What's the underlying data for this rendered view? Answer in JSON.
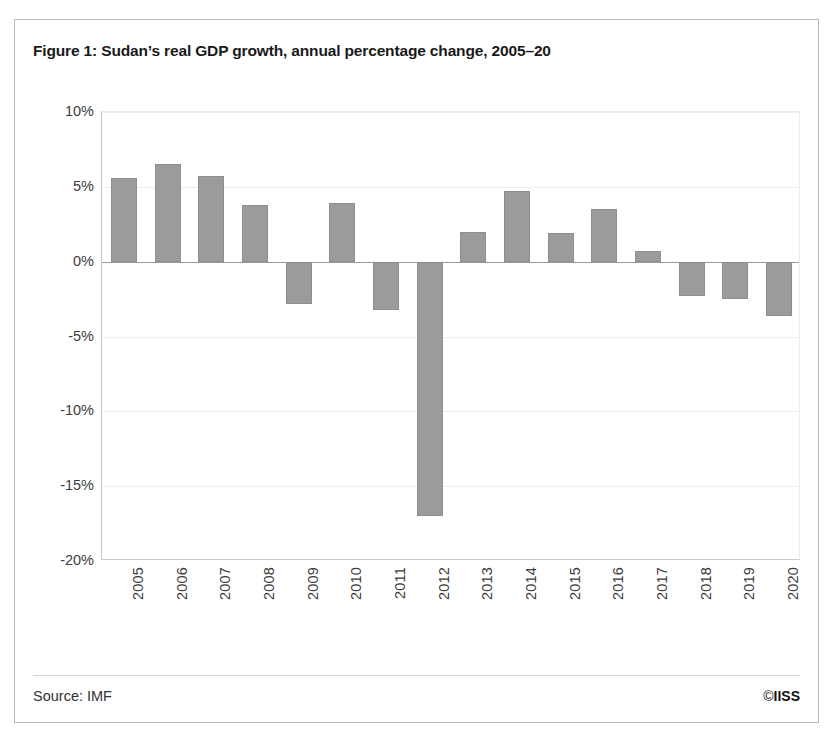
{
  "figure": {
    "title": "Figure 1: Sudan’s real GDP growth, annual percentage change, 2005–20",
    "source": "Source: IMF",
    "copyright_symbol": "©",
    "copyright_owner": "IISS"
  },
  "style": {
    "bar_color": "#9b9b9b",
    "bar_border_color": "#8e8e8e",
    "gridline_color": "#ededed",
    "zero_line_color": "#9a9a9a",
    "axis_color": "#c4c4c4",
    "frame_color": "#b9b9b9",
    "text_color": "#3c3c3c",
    "title_color": "#1a1a1a",
    "background": "#ffffff"
  },
  "chart_data": {
    "type": "bar",
    "title": "Figure 1: Sudan’s real GDP growth, annual percentage change, 2005–20",
    "xlabel": "",
    "ylabel": "",
    "ylim": [
      -20,
      10
    ],
    "ytick_values": [
      10,
      5,
      0,
      -5,
      -10,
      -15,
      -20
    ],
    "ytick_labels": [
      "10%",
      "5%",
      "0%",
      "-5%",
      "-10%",
      "-15%",
      "-20%"
    ],
    "grid": true,
    "grid_axis": "y",
    "legend": false,
    "categories": [
      "2005",
      "2006",
      "2007",
      "2008",
      "2009",
      "2010",
      "2011",
      "2012",
      "2013",
      "2014",
      "2015",
      "2016",
      "2017",
      "2018",
      "2019",
      "2020"
    ],
    "values": [
      5.6,
      6.5,
      5.7,
      3.8,
      -2.8,
      3.9,
      -3.2,
      -17.0,
      2.0,
      4.7,
      1.9,
      3.5,
      0.7,
      -2.3,
      -2.5,
      -3.6
    ],
    "units": "percent",
    "series": [
      {
        "name": "Real GDP growth",
        "values": [
          5.6,
          6.5,
          5.7,
          3.8,
          -2.8,
          3.9,
          -3.2,
          -17.0,
          2.0,
          4.7,
          1.9,
          3.5,
          0.7,
          -2.3,
          -2.5,
          -3.6
        ]
      }
    ]
  }
}
